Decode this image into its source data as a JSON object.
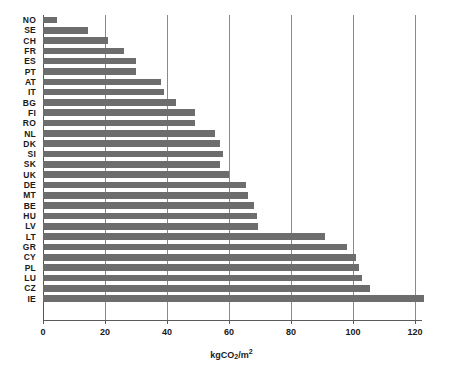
{
  "chart_data": {
    "type": "bar",
    "orientation": "horizontal",
    "title": "",
    "subtitle": "",
    "xlabel": "kgCO2/m2",
    "xlabel_parts": {
      "prefix": "kgCO",
      "sub": "2",
      "mid": "/m",
      "sup": "2"
    },
    "ylabel": "",
    "xlim": [
      0,
      126
    ],
    "xticks": [
      0,
      20,
      40,
      60,
      80,
      100,
      120
    ],
    "xticklabels": [
      "0",
      "20",
      "40",
      "60",
      "80",
      "100",
      "120"
    ],
    "grid": "vertical-gridlines-at-xticks",
    "legend": "none",
    "bar_color": "#6d6d6d",
    "categories": [
      "NO",
      "SE",
      "CH",
      "FR",
      "ES",
      "PT",
      "AT",
      "IT",
      "BG",
      "FI",
      "RO",
      "NL",
      "DK",
      "SI",
      "SK",
      "UK",
      "DE",
      "MT",
      "BE",
      "HU",
      "LV",
      "LT",
      "GR",
      "CY",
      "PL",
      "LU",
      "CZ",
      "IE"
    ],
    "values": [
      4.5,
      14.5,
      21,
      26,
      30,
      38,
      39,
      43,
      49,
      49,
      55.5,
      57,
      58,
      57,
      60,
      65.5,
      66,
      68,
      69,
      69.5,
      91,
      98,
      101,
      102,
      103,
      105,
      106,
      123
    ],
    "series": [
      {
        "name": "Embodied carbon",
        "points": [
          {
            "category": "NO",
            "value": 4.5
          },
          {
            "category": "SE",
            "value": 14.5
          },
          {
            "category": "CH",
            "value": 21
          },
          {
            "category": "FR",
            "value": 26
          },
          {
            "category": "ES",
            "value": 30
          },
          {
            "category": "PT",
            "value": 30
          },
          {
            "category": "AT",
            "value": 38
          },
          {
            "category": "IT",
            "value": 39
          },
          {
            "category": "BG",
            "value": 43
          },
          {
            "category": "FI",
            "value": 49
          },
          {
            "category": "RO",
            "value": 49
          },
          {
            "category": "NL",
            "value": 55.5
          },
          {
            "category": "DK",
            "value": 57
          },
          {
            "category": "SI",
            "value": 58
          },
          {
            "category": "SK",
            "value": 57
          },
          {
            "category": "UK",
            "value": 60
          },
          {
            "category": "DE",
            "value": 65.5
          },
          {
            "category": "MT",
            "value": 66
          },
          {
            "category": "BE",
            "value": 68
          },
          {
            "category": "HU",
            "value": 69
          },
          {
            "category": "LV",
            "value": 69.5
          },
          {
            "category": "LT",
            "value": 91
          },
          {
            "category": "GR",
            "value": 98
          },
          {
            "category": "CY",
            "value": 101
          },
          {
            "category": "PL",
            "value": 102
          },
          {
            "category": "LU",
            "value": 105
          },
          {
            "category": "CZ",
            "value": 105.5
          },
          {
            "category": "IE",
            "value": 123
          }
        ]
      }
    ],
    "bars": [
      {
        "label": "NO",
        "value": 4.5
      },
      {
        "label": "SE",
        "value": 14.5
      },
      {
        "label": "CH",
        "value": 21
      },
      {
        "label": "FR",
        "value": 26
      },
      {
        "label": "ES",
        "value": 30
      },
      {
        "label": "PT",
        "value": 30
      },
      {
        "label": "AT",
        "value": 38
      },
      {
        "label": "IT",
        "value": 39
      },
      {
        "label": "BG",
        "value": 43
      },
      {
        "label": "FI",
        "value": 49
      },
      {
        "label": "RO",
        "value": 49
      },
      {
        "label": "NL",
        "value": 55.5
      },
      {
        "label": "DK",
        "value": 57
      },
      {
        "label": "SI",
        "value": 58
      },
      {
        "label": "SK",
        "value": 57
      },
      {
        "label": "UK",
        "value": 60
      },
      {
        "label": "DE",
        "value": 65.5
      },
      {
        "label": "MT",
        "value": 66
      },
      {
        "label": "BE",
        "value": 68
      },
      {
        "label": "HU",
        "value": 69
      },
      {
        "label": "LV",
        "value": 69.5
      },
      {
        "label": "LT",
        "value": 91
      },
      {
        "label": "GR",
        "value": 98
      },
      {
        "label": "CY",
        "value": 101
      },
      {
        "label": "PL",
        "value": 102
      },
      {
        "label": "LU",
        "value": 103
      },
      {
        "label": "CZ",
        "value": 105.5
      },
      {
        "label": "IE",
        "value": 123
      }
    ]
  }
}
